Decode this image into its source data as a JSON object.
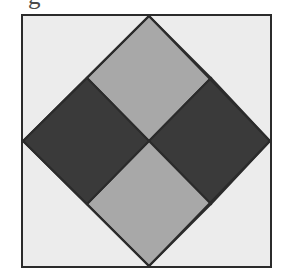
{
  "figure": {
    "caption_fragment": "g",
    "outer_frame": {
      "name": "square plate",
      "fill_color": "#ececec",
      "stroke_color": "#2b2b2b",
      "stroke_width": 2
    },
    "inscribed_diamond": {
      "name": "rotated inscribed square",
      "stroke_color": "#2b2b2b",
      "stroke_width": 2,
      "vertices": [
        {
          "position": "top",
          "x": 128,
          "y": 2
        },
        {
          "position": "right",
          "x": 249,
          "y": 127
        },
        {
          "position": "bottom",
          "x": 128,
          "y": 252
        },
        {
          "position": "left",
          "x": 2,
          "y": 127
        }
      ]
    },
    "quadrants": [
      {
        "name": "top-quadrant",
        "shade": "medium-gray",
        "fill_color": "#a8a8a8"
      },
      {
        "name": "right-quadrant",
        "shade": "dark-gray",
        "fill_color": "#3a3a3a"
      },
      {
        "name": "bottom-quadrant",
        "shade": "medium-gray",
        "fill_color": "#a8a8a8"
      },
      {
        "name": "left-quadrant",
        "shade": "dark-gray",
        "fill_color": "#3a3a3a"
      }
    ],
    "background_corners": {
      "name": "corner triangles",
      "fill_color": "#ececec"
    },
    "center_point": {
      "x": 128,
      "y": 127
    }
  }
}
